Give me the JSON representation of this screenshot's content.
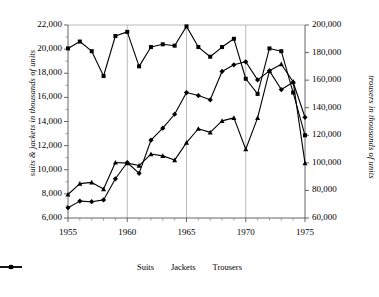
{
  "chart_data": {
    "type": "line",
    "title": "",
    "xlabel": "",
    "ylabel": "suits & jackets in thousands of units",
    "y2label": "trousers in thousands of units",
    "x": [
      1955,
      1956,
      1957,
      1958,
      1959,
      1960,
      1961,
      1962,
      1963,
      1964,
      1965,
      1966,
      1967,
      1968,
      1969,
      1970,
      1971,
      1972,
      1973,
      1974,
      1975
    ],
    "xlim": [
      1955,
      1975
    ],
    "ylim": [
      6000,
      22000
    ],
    "y2lim": [
      60000,
      200000
    ],
    "xticks": [
      "1955",
      "1960",
      "1965",
      "1970",
      "1975"
    ],
    "xtick_values": [
      1955,
      1960,
      1965,
      1970,
      1975
    ],
    "yticks": [
      "6,000",
      "8,000",
      "10,000",
      "12,000",
      "14,000",
      "16,000",
      "18,000",
      "20,000",
      "22,000"
    ],
    "ytick_values": [
      6000,
      8000,
      10000,
      12000,
      14000,
      16000,
      18000,
      20000,
      22000
    ],
    "y2ticks": [
      "60,000",
      "80,000",
      "100,000",
      "120,000",
      "140,000",
      "160,000",
      "180,000",
      "200,000"
    ],
    "y2tick_values": [
      60000,
      80000,
      100000,
      120000,
      140000,
      160000,
      180000,
      200000
    ],
    "grid": "vertical gridlines at 1960, 1965, 1970",
    "gridlines": [
      1960,
      1965,
      1970
    ],
    "legend_position": "bottom-center",
    "series": [
      {
        "name": "Suits",
        "axis": "left",
        "marker": "diamond",
        "color": "#000000",
        "values": [
          6850,
          7400,
          7350,
          7500,
          9250,
          10600,
          9700,
          12450,
          13450,
          14600,
          16400,
          16150,
          15800,
          18150,
          18700,
          18950,
          17450,
          18200,
          16650,
          17250,
          14350
        ]
      },
      {
        "name": "Jackets",
        "axis": "left",
        "marker": "triangle",
        "color": "#000000",
        "values": [
          7950,
          8850,
          8950,
          8400,
          10600,
          10550,
          10350,
          11300,
          11150,
          10800,
          12250,
          13400,
          13100,
          14050,
          14300,
          11700,
          14300,
          18200,
          18750,
          17300,
          10550
        ]
      },
      {
        "name": "Trousers",
        "axis": "right",
        "marker": "square",
        "color": "#000000",
        "values": [
          183000,
          188000,
          181000,
          163000,
          192000,
          195000,
          170000,
          184000,
          186000,
          185000,
          199000,
          184000,
          177000,
          184000,
          190000,
          161000,
          150000,
          183000,
          181000,
          151000,
          120000
        ]
      }
    ]
  },
  "legend": {
    "items": [
      {
        "label": "Suits",
        "marker": "diamond"
      },
      {
        "label": "Jackets",
        "marker": "triangle"
      },
      {
        "label": "Trousers",
        "marker": "square"
      }
    ]
  }
}
